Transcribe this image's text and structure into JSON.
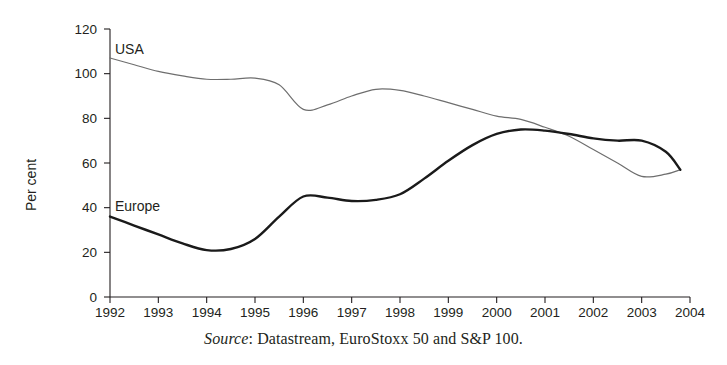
{
  "caption": {
    "source_word": "Source",
    "source_rest": ": Datastream, EuroStoxx 50 and S&P 100."
  },
  "axes": {
    "ylabel": "Per cent",
    "y_ticks": [
      "0",
      "20",
      "40",
      "60",
      "80",
      "100",
      "120"
    ],
    "x_ticks": [
      "1992",
      "1993",
      "1994",
      "1995",
      "1996",
      "1997",
      "1998",
      "1999",
      "2000",
      "2001",
      "2002",
      "2003",
      "2004"
    ]
  },
  "labels": {
    "usa": "USA",
    "europe": "Europe"
  },
  "colors": {
    "usa_line": "#6e6e6e",
    "europe_line": "#1a1a1a",
    "axis": "#231f20",
    "text": "#231f20",
    "background": "#ffffff"
  },
  "chart_data": {
    "type": "line",
    "title": "",
    "subtitle": "",
    "xlabel": "",
    "ylabel": "Per cent",
    "xlim": [
      1992,
      2004
    ],
    "ylim": [
      0,
      120
    ],
    "y_ticks": [
      0,
      20,
      40,
      60,
      80,
      100,
      120
    ],
    "x_ticks": [
      1992,
      1993,
      1994,
      1995,
      1996,
      1997,
      1998,
      1999,
      2000,
      2001,
      2002,
      2003,
      2004
    ],
    "grid": false,
    "legend": "inline-annotations",
    "annotations": [
      {
        "text": "USA",
        "x": 1992.1,
        "y": 113
      },
      {
        "text": "Europe",
        "x": 1992.1,
        "y": 44
      }
    ],
    "x": [
      1992,
      1992.5,
      1993,
      1993.5,
      1994,
      1994.5,
      1995,
      1995.5,
      1996,
      1996.5,
      1997,
      1997.5,
      1998,
      1998.5,
      1999,
      1999.5,
      2000,
      2000.5,
      2001,
      2001.5,
      2002,
      2002.5,
      2003,
      2003.5,
      2003.8
    ],
    "series": [
      {
        "name": "USA",
        "color": "#6e6e6e",
        "linewidth": 1.2,
        "values": [
          107,
          104,
          101,
          99,
          97.5,
          97.5,
          98,
          95,
          84,
          86,
          90,
          93,
          92.5,
          90,
          87,
          84,
          81,
          79.5,
          76,
          72,
          66,
          60,
          54,
          55,
          57
        ]
      },
      {
        "name": "Europe",
        "color": "#1a1a1a",
        "linewidth": 2.4,
        "values": [
          36,
          32,
          28,
          24,
          21,
          21.5,
          26,
          36,
          45,
          44.5,
          43,
          43.5,
          46,
          53,
          61,
          68,
          73,
          75,
          74.5,
          73,
          71,
          70,
          70,
          65,
          57
        ]
      }
    ]
  }
}
